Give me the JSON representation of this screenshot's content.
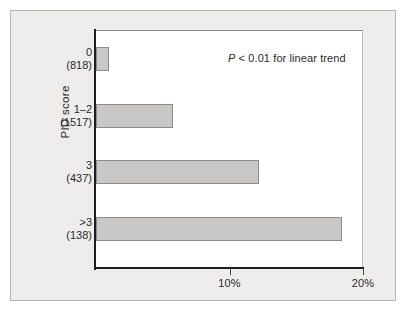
{
  "figure": {
    "background_color": "#eeedec",
    "plot_background_color": "#ffffff",
    "axis_color": "#1d1d1d",
    "bar_fill_color": "#c9c8c6",
    "bar_edge_color": "#8e8c8a"
  },
  "annotation": {
    "p_symbol": "P",
    "rest": " < 0.01 for linear trend",
    "full": "P < 0.01 for linear trend"
  },
  "axes": {
    "ylabel": "PID score",
    "xticklabels": [
      "10%",
      "20%"
    ],
    "xtickvalues": [
      10,
      20
    ]
  },
  "chart_data": {
    "type": "bar",
    "orientation": "horizontal",
    "title": "",
    "xlabel": "",
    "ylabel": "PID score",
    "categories": [
      "0",
      "1–2",
      "3",
      ">3"
    ],
    "category_counts": [
      "(818)",
      "(1517)",
      "(437)",
      "(138)"
    ],
    "values": [
      1.0,
      5.8,
      12.2,
      18.4
    ],
    "value_unit": "%",
    "xlim": [
      0,
      20
    ],
    "xticks": [
      10,
      20
    ],
    "xticklabels": [
      "10%",
      "20%"
    ],
    "grid": false,
    "legend": false,
    "annotations": [
      "P < 0.01 for linear trend"
    ]
  }
}
